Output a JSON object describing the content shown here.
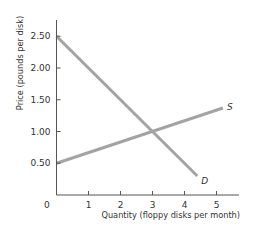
{
  "chart_data": {
    "type": "line",
    "title": "",
    "xlabel": "Quantity (floppy disks per month)",
    "ylabel": "Price (pounds per disk)",
    "xlim": [
      0,
      5.7
    ],
    "ylim": [
      0,
      2.75
    ],
    "x_ticks": [
      1,
      2,
      3,
      4,
      5
    ],
    "x_tick_labels": [
      "1",
      "2",
      "3",
      "4",
      "5"
    ],
    "y_ticks": [
      0.5,
      1.0,
      1.5,
      2.0,
      2.5
    ],
    "y_tick_labels": [
      "0.50",
      "1.00",
      "1.50",
      "2.00",
      "2.50"
    ],
    "origin_label": "0",
    "grid": false,
    "legend": "inline labels at line ends",
    "series": [
      {
        "name": "S",
        "label": "S",
        "x": [
          0,
          5.2
        ],
        "y": [
          0.5,
          1.37
        ],
        "color": "#a3a3a3"
      },
      {
        "name": "D",
        "label": "D",
        "x": [
          0,
          4.4
        ],
        "y": [
          2.5,
          0.3
        ],
        "color": "#a3a3a3"
      }
    ],
    "equilibrium": {
      "quantity": 3,
      "price": 1.0
    }
  },
  "style": {
    "axis_color": "#555555",
    "line_color": "#a3a3a3"
  }
}
